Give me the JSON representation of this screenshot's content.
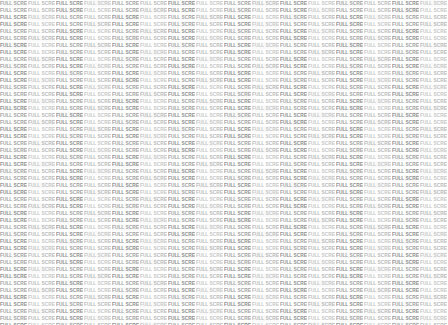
{
  "canvas": {
    "width": 448,
    "height": 325,
    "background_color": "#ffffff",
    "description": "Dense tiled watermark field"
  },
  "watermark": {
    "text": "FULL SCREEN",
    "repeat_text": "FULL SCREEN",
    "columns": 16,
    "rows": 47,
    "tile_width_px": 28,
    "tile_height_px": 7,
    "font_size_px": 5,
    "text_transform": "uppercase",
    "colors": {
      "tone_a": "#9a9a9a",
      "tone_b": "#b4b4b4",
      "tone_c": "#868686",
      "tone_d": "#c2c2c2",
      "background": "#ffffff"
    }
  }
}
